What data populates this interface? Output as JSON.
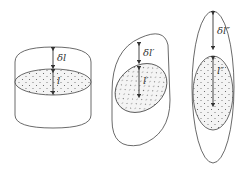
{
  "figures": [
    {
      "id": "cylinder",
      "gap_label": "δl",
      "length_label": "l"
    },
    {
      "id": "oblique",
      "gap_label": "δl′",
      "length_label": "l′"
    },
    {
      "id": "elongated",
      "gap_label": "δl″",
      "length_label": "l″"
    }
  ],
  "colors": {
    "stroke": "#444444",
    "fill": "#f4f4f4",
    "dots": "#555555"
  }
}
